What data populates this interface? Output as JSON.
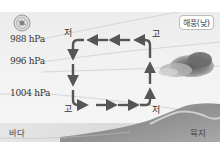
{
  "diagram": {
    "title_badge": "해풍(낮)",
    "icon": "sun-icon",
    "isobars": [
      {
        "label": "988 hPa"
      },
      {
        "label": "996 hPa"
      },
      {
        "label": "1004 hPa"
      }
    ],
    "pressure_markers": {
      "upper_left": "저",
      "upper_right": "고",
      "lower_left": "고",
      "lower_right": "저"
    },
    "ground": {
      "left": "바다",
      "right": "육지"
    },
    "circulation": {
      "direction": "clockwise-reversed: surface sea→land, rising over land, aloft land→sea, sinking over sea",
      "arrow_color": "#555555"
    },
    "colors": {
      "background": "#efefef",
      "arrow": "#555555",
      "isobar": "#c8c8c8",
      "sea": "#d6d6d6",
      "land": "#9a9a9a"
    }
  }
}
